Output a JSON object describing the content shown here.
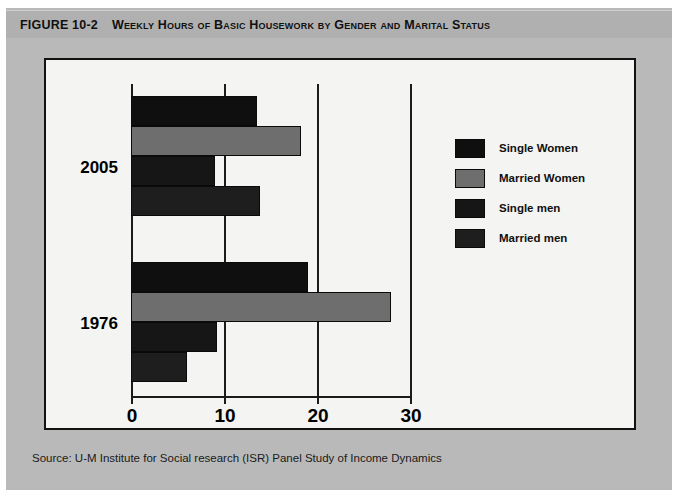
{
  "figure": {
    "number_label": "Figure 10-2",
    "title": "Weekly Hours of Basic Housework by Gender and Marital Status",
    "source_note": "Source: U-M Institute for Social research (ISR) Panel Study of Income Dynamics"
  },
  "chart_data": {
    "type": "bar",
    "orientation": "horizontal",
    "title": "Weekly Hours of Basic Housework by Gender and Marital Status",
    "xlabel": "",
    "ylabel": "",
    "xlim": [
      0,
      30
    ],
    "xticks": [
      0,
      10,
      20,
      30
    ],
    "xtick_labels": [
      "0",
      "10",
      "20",
      "30"
    ],
    "grid": true,
    "grid_axis": "x",
    "legend_position": "right",
    "categories": [
      "2005",
      "1976"
    ],
    "series": [
      {
        "name": "Single Women",
        "color": "#0f0f0f",
        "values": [
          13.5,
          19.0
        ]
      },
      {
        "name": "Married Women",
        "color": "#6e6e6e",
        "values": [
          18.3,
          28.0
        ]
      },
      {
        "name": "Single men",
        "color": "#161616",
        "values": [
          9.0,
          9.2
        ]
      },
      {
        "name": "Married men",
        "color": "#1e1e1e",
        "values": [
          13.9,
          6.0
        ]
      }
    ]
  },
  "axis": {
    "tick_labels": [
      "0",
      "10",
      "20",
      "30"
    ]
  },
  "groups": [
    {
      "label": "2005"
    },
    {
      "label": "1976"
    }
  ],
  "legend": {
    "items": [
      {
        "label": "Single Women",
        "color": "#0f0f0f"
      },
      {
        "label": "Married Women",
        "color": "#6e6e6e"
      },
      {
        "label": "Single men",
        "color": "#161616"
      },
      {
        "label": "Married men",
        "color": "#1e1e1e"
      }
    ]
  },
  "colors": {
    "plate": "#b9b9b9",
    "title_bar": "#b0b0b0",
    "panel_bg": "#f4f4f2",
    "ink": "#111111"
  }
}
